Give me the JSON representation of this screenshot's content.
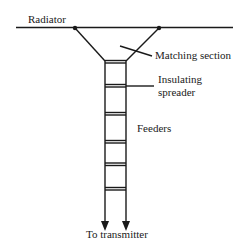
{
  "diagram": {
    "type": "antenna feed (matched ladder line)",
    "labels": {
      "radiator": "Radiator",
      "matching_section": "Matching section",
      "insulating_spreader_line1": "Insulating",
      "insulating_spreader_line2": "spreader",
      "feeders": "Feeders",
      "to_transmitter": "To transmitter"
    },
    "colors": {
      "line": "#1a1a1a",
      "background": "#ffffff"
    },
    "rung_count": 6
  }
}
